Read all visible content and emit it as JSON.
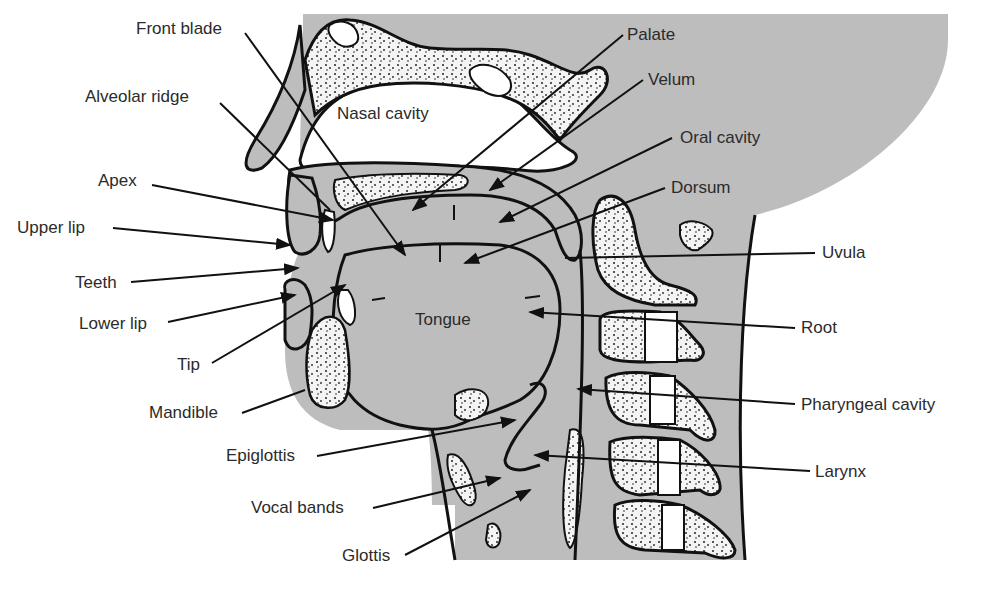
{
  "diagram": {
    "colors": {
      "tissue": "#b8b8b8",
      "bone_fill": "#f2f2f2",
      "outline": "#111111",
      "text": "#2b2b2b",
      "background": "#ffffff"
    },
    "labels": {
      "front_blade": "Front blade",
      "alveolar_ridge": "Alveolar ridge",
      "apex": "Apex",
      "upper_lip": "Upper lip",
      "teeth": "Teeth",
      "lower_lip": "Lower lip",
      "tip": "Tip",
      "mandible": "Mandible",
      "epiglottis": "Epiglottis",
      "vocal_bands": "Vocal bands",
      "glottis": "Glottis",
      "palate": "Palate",
      "velum": "Velum",
      "oral_cavity": "Oral cavity",
      "dorsum": "Dorsum",
      "uvula": "Uvula",
      "root": "Root",
      "pharyngeal_cavity": "Pharyngeal cavity",
      "larynx": "Larynx",
      "nasal_cavity": "Nasal cavity",
      "tongue": "Tongue"
    }
  }
}
